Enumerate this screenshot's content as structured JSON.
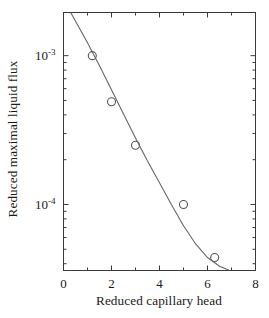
{
  "chart_data": {
    "type": "scatter",
    "title": "",
    "xlabel": "Reduced capillary head",
    "ylabel": "Reduced maximal liquid flux",
    "yscale": "log",
    "xscale": "linear",
    "xlim": [
      0,
      8
    ],
    "ylim": [
      3.6e-05,
      0.00195
    ],
    "grid": false,
    "legend": null,
    "x_ticks": [
      {
        "value": 0,
        "label": "0",
        "major": true
      },
      {
        "value": 1,
        "label": "",
        "major": false
      },
      {
        "value": 2,
        "label": "2",
        "major": true
      },
      {
        "value": 3,
        "label": "",
        "major": false
      },
      {
        "value": 4,
        "label": "4",
        "major": true
      },
      {
        "value": 5,
        "label": "",
        "major": false
      },
      {
        "value": 6,
        "label": "6",
        "major": true
      },
      {
        "value": 7,
        "label": "",
        "major": false
      },
      {
        "value": 8,
        "label": "8",
        "major": true
      }
    ],
    "y_ticks": [
      {
        "value": 0.001,
        "label": "10",
        "exponent": "-3",
        "major": true
      },
      {
        "value": 0.0001,
        "label": "10",
        "exponent": "-4",
        "major": true
      }
    ],
    "series": [
      {
        "name": "measured data",
        "marker": "open-circle",
        "color": "#555555",
        "x": [
          1.2,
          2.0,
          3.0,
          5.0,
          6.3
        ],
        "y": [
          0.001,
          0.00049,
          0.00025,
          0.0001,
          4.4e-05
        ]
      },
      {
        "name": "fitted curve",
        "marker": "none",
        "style": "solid-line",
        "color": "#666666",
        "x": [
          0.3,
          1.0,
          1.5,
          2.0,
          2.5,
          3.0,
          3.5,
          4.0,
          4.5,
          5.0,
          5.5,
          6.0,
          6.5,
          6.9
        ],
        "y": [
          0.00195,
          0.00122,
          0.000855,
          0.00059,
          0.000405,
          0.00028,
          0.000196,
          0.00014,
          9.95e-05,
          7.2e-05,
          5.45e-05,
          4.4e-05,
          3.85e-05,
          3.62e-05
        ]
      }
    ]
  },
  "labels": {
    "y_axis_title": "Reduced maximal liquid flux",
    "x_axis_title": "Reduced capillary head",
    "y_tick_high_mantissa": "10",
    "y_tick_high_exponent": "-3",
    "y_tick_low_mantissa": "10",
    "y_tick_low_exponent": "-4",
    "x_tick_0": "0",
    "x_tick_2": "2",
    "x_tick_4": "4",
    "x_tick_6": "6",
    "x_tick_8": "8"
  },
  "colors": {
    "axis": "#3a3a3a",
    "curve": "#666666",
    "marker": "#555555",
    "background": "#ffffff",
    "text": "#1a1a1a"
  }
}
